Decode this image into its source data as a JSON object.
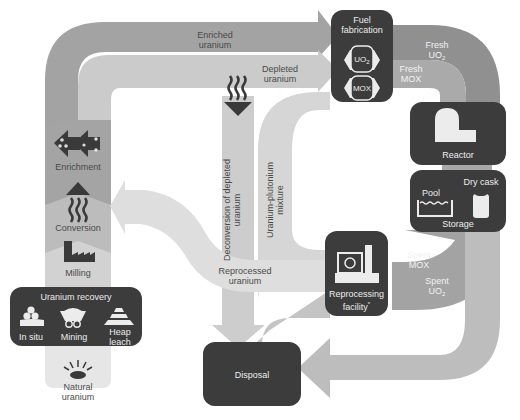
{
  "diagram": {
    "colors": {
      "box": "#3c3c3c",
      "enriched_flow": "#9a9a9a",
      "depleted_flow": "#c6c6c6",
      "light_flow": "#dadada",
      "fresh_uo2_flow": "#8e8e8e",
      "fresh_mox_flow": "#a8a8a8",
      "spent_flow": "#a3a3a3",
      "disposal_flow": "#bdbdbd",
      "box_text": "#ececec",
      "label_text": "#4a4a4a"
    },
    "front_end": {
      "natural_uranium": "Natural uranium",
      "recovery": {
        "title": "Uranium recovery",
        "methods": [
          "In situ",
          "Mining",
          "Heap leach"
        ]
      },
      "milling": "Milling",
      "conversion": "Conversion",
      "enrichment": "Enrichment"
    },
    "flows": {
      "enriched_uranium": "Enriched uranium",
      "depleted_uranium": "Depleted uranium",
      "deconversion": "Deconversion of depleted uranium",
      "uranium_plutonium": "Uranium-plutonium mixture",
      "reprocessed_uranium": "Reprocessed uranium",
      "fresh_uo2": "Fresh UO",
      "fresh_uo2_sub": "2",
      "fresh_mox": "Fresh MOX",
      "spent_mox": "Spent MOX",
      "spent_uo2": "Spent UO",
      "spent_uo2_sub": "2"
    },
    "fuel_fabrication": {
      "title_line1": "Fuel",
      "title_line2": "fabrication",
      "uo2": "UO",
      "uo2_sub": "2",
      "mox": "MOX"
    },
    "reactor": {
      "title": "Reactor"
    },
    "storage": {
      "title": "Storage",
      "pool": "Pool",
      "dry_cask": "Dry cask"
    },
    "reprocessing": {
      "title_line1": "Reprocessing",
      "title_line2": "facility",
      "footnote_mark": "*"
    },
    "disposal": {
      "title": "Disposal"
    }
  }
}
